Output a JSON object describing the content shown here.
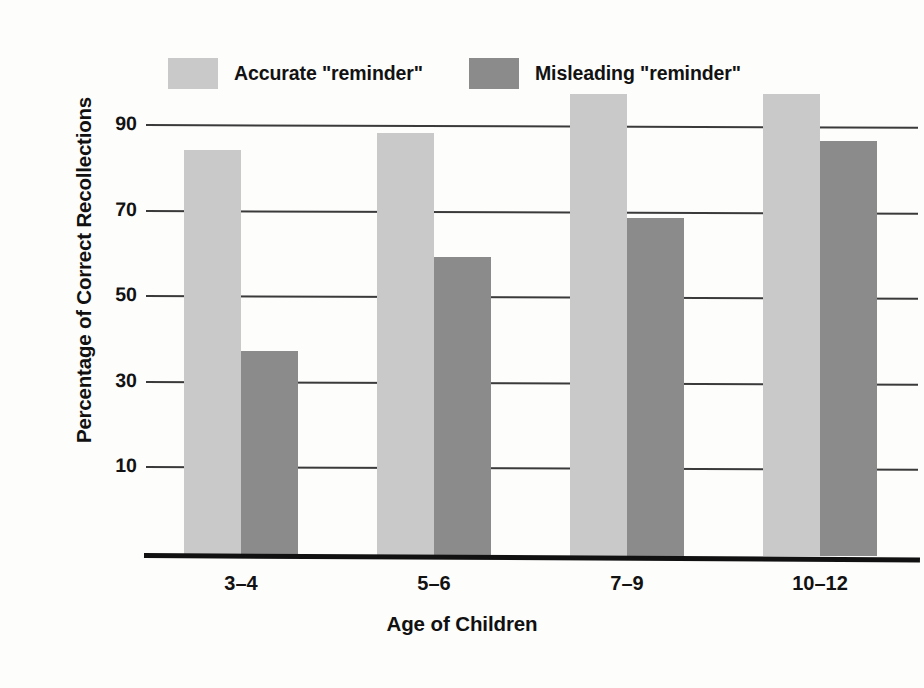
{
  "chart_data": {
    "type": "bar",
    "title": "",
    "xlabel": "Age of Children",
    "ylabel": "Percentage of Correct Recollections",
    "categories": [
      "3–4",
      "5–6",
      "7–9",
      "10–12"
    ],
    "series": [
      {
        "name": "Accurate \"reminder\"",
        "values": [
          84,
          88,
          97,
          97
        ],
        "color": "#c9c9c9"
      },
      {
        "name": "Misleading \"reminder\"",
        "values": [
          37,
          59,
          68,
          86
        ],
        "color": "#8b8b8b"
      }
    ],
    "yticks": [
      90,
      70,
      50,
      30,
      10
    ],
    "ylim": [
      0,
      100
    ],
    "grid": true,
    "legend_position": "top-left",
    "background": "#fdfdfc",
    "axis_color": "#111111",
    "gridline_color": "#3a3a3a"
  },
  "legend": {
    "entries": [
      {
        "label": "Accurate \"reminder\""
      },
      {
        "label": "Misleading \"reminder\""
      }
    ]
  },
  "axes": {
    "y_title": "Percentage of Correct Recollections",
    "x_title": "Age of Children",
    "y_tick_labels": [
      "90",
      "70",
      "50",
      "30",
      "10"
    ],
    "x_tick_labels": [
      "3–4",
      "5–6",
      "7–9",
      "10–12"
    ]
  }
}
